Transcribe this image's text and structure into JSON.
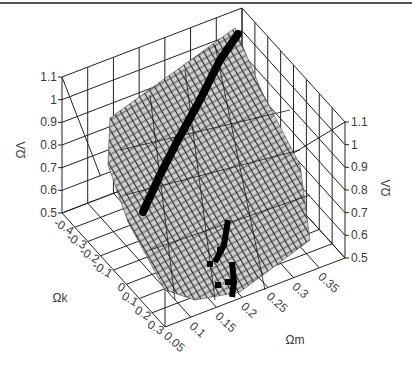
{
  "chart_data": {
    "type": "surface3d",
    "title": "",
    "axes": {
      "x": {
        "label": "Ωm",
        "ticks": [
          "0.05",
          "0.1",
          "0.15",
          "0.2",
          "0.25",
          "0.3",
          "0.35"
        ],
        "range": [
          0.05,
          0.4
        ]
      },
      "y": {
        "label": "Ωk",
        "ticks": [
          "-0.4",
          "-0.3",
          "-0.2",
          "-0.1",
          "0",
          "0.1",
          "0.2",
          "0.3"
        ],
        "range": [
          -0.5,
          0.3
        ]
      },
      "z": {
        "label": "ΩΛ",
        "ticks": [
          "0.5",
          "0.6",
          "0.7",
          "0.8",
          "0.9",
          "1",
          "1.1"
        ],
        "range": [
          0.5,
          1.1
        ]
      }
    },
    "grid": true,
    "legend": null,
    "series": [
      {
        "name": "surface",
        "kind": "hatched-plane",
        "relation": "ΩΛ = 1 - Ωm - Ωk",
        "color": "#8a8a8a"
      },
      {
        "name": "curve-1",
        "kind": "thick-line",
        "color": "#000000",
        "points_approx": [
          {
            "Ωm": 0.05,
            "Ωk": -0.1,
            "ΩΛ": 0.75
          },
          {
            "Ωm": 0.2,
            "Ωk": -0.45,
            "ΩΛ": 1.1
          }
        ]
      },
      {
        "name": "curve-2",
        "kind": "scattered-segments",
        "color": "#000000",
        "points_approx": [
          {
            "Ωm": 0.15,
            "Ωk": 0.1,
            "ΩΛ": 0.75
          },
          {
            "Ωm": 0.2,
            "Ωk": 0.1,
            "ΩΛ": 0.55
          }
        ]
      }
    ]
  },
  "labels": {
    "z_left_title": "ΩΛ",
    "z_right_title": "ΩΛ",
    "x_title": "Ωm",
    "y_title": "Ωk",
    "z_left_ticks": [
      "1.1",
      "1",
      "0.9",
      "0.8",
      "0.7",
      "0.6",
      "0.5"
    ],
    "z_right_ticks": [
      "1.1",
      "1",
      "0.9",
      "0.8",
      "0.7",
      "0.6",
      "0.5"
    ],
    "k_ticks": [
      "-0.4",
      "-0.3",
      "-0.2",
      "-0.1",
      "0",
      "0.1",
      "0.2",
      "0.3"
    ],
    "m_ticks": [
      "0.05",
      "0.1",
      "0.15",
      "0.2",
      "0.25",
      "0.3",
      "0.35"
    ]
  }
}
